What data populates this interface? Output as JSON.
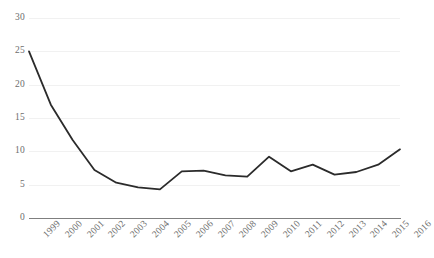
{
  "chart_data": {
    "type": "line",
    "title": "",
    "subtitle": "",
    "xlabel": "",
    "ylabel": "",
    "categories": [
      "1999",
      "2000",
      "2001",
      "2002",
      "2003",
      "2004",
      "2005",
      "2006",
      "2007",
      "2008",
      "2009",
      "2010",
      "2011",
      "2012",
      "2013",
      "2014",
      "2015",
      "2016"
    ],
    "series": [
      {
        "name": "series-1",
        "color": "#2b2b2b",
        "values": [
          25.0,
          17.0,
          11.7,
          7.2,
          5.3,
          4.6,
          4.3,
          7.0,
          7.1,
          6.4,
          6.2,
          9.2,
          7.0,
          8.0,
          6.5,
          6.9,
          8.0,
          10.3
        ]
      }
    ],
    "ylim": [
      0,
      30
    ],
    "y_ticks": [
      0,
      5,
      10,
      15,
      20,
      25,
      30
    ],
    "y_tick_labels": [
      "0",
      "5",
      "10",
      "15",
      "20",
      "25",
      "30"
    ],
    "grid": true,
    "grid_axis": "y",
    "legend": false,
    "legend_position": "none",
    "markers": false,
    "annotations": []
  },
  "style": {
    "background_color": "#ffffff",
    "gridline_color": "#f1f1f1",
    "axis_color": "#7f7f7f",
    "tick_label_color": "#6d6d6d",
    "line_color": "#2b2b2b",
    "line_width": 1.8
  }
}
